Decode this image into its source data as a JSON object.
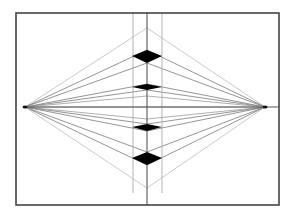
{
  "diagram": {
    "title": "Two-point perspective construction with stacked rhombi",
    "type": "two-point-perspective",
    "frame": {
      "x1": 16,
      "y1": 13,
      "x2": 279,
      "y2": 205,
      "stroke": "#444444"
    },
    "horizon": {
      "y": 107,
      "x1": 25,
      "x2": 279,
      "stroke": "#555555"
    },
    "vanishing_points": [
      {
        "id": "vp-left",
        "x": 25,
        "y": 107
      },
      {
        "id": "vp-right",
        "x": 265,
        "y": 107
      }
    ],
    "verticals": [
      {
        "id": "left-edge",
        "x": 133,
        "y1": 13,
        "y2": 193,
        "stroke": "#aaaaaa"
      },
      {
        "id": "center-axis",
        "x": 147,
        "y1": 13,
        "y2": 205,
        "stroke": "#666666"
      },
      {
        "id": "right-edge",
        "x": 162,
        "y1": 13,
        "y2": 193,
        "stroke": "#aaaaaa"
      }
    ],
    "apexes": [
      {
        "id": "top-apex",
        "x": 147,
        "y": 28
      },
      {
        "id": "bottom-apex",
        "x": 147,
        "y": 188
      }
    ],
    "guide_points_on_axis": [
      28,
      50,
      63,
      84,
      90,
      96,
      107,
      119,
      124,
      131,
      152,
      165,
      188
    ],
    "rhombi": [
      {
        "id": "rhombus-1",
        "cx": 147,
        "cy": 56,
        "left": 132,
        "right": 162,
        "top": 50,
        "bottom": 63,
        "fill": "#000000"
      },
      {
        "id": "rhombus-2",
        "cx": 147,
        "cy": 87,
        "left": 132,
        "right": 162,
        "top": 84,
        "bottom": 90,
        "fill": "#000000"
      },
      {
        "id": "rhombus-3",
        "cx": 147,
        "cy": 127,
        "left": 132,
        "right": 162,
        "top": 124,
        "bottom": 131,
        "fill": "#000000"
      },
      {
        "id": "rhombus-4",
        "cx": 147,
        "cy": 158,
        "left": 132,
        "right": 162,
        "top": 152,
        "bottom": 165,
        "fill": "#000000"
      }
    ],
    "colors": {
      "background": "#ffffff",
      "frame": "#444444",
      "guide_light": "#b5b5b5",
      "guide_dark": "#7a7a7a",
      "fill": "#000000"
    }
  }
}
